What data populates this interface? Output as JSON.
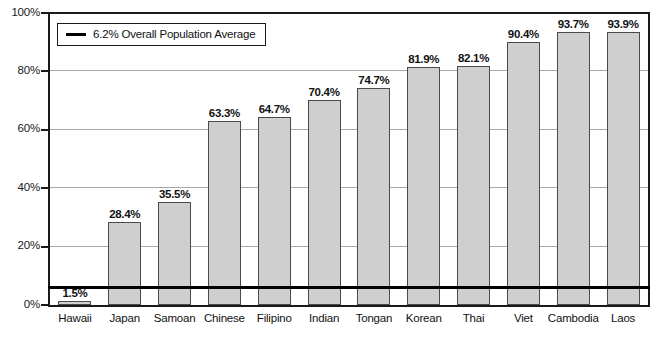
{
  "chart_data": {
    "type": "bar",
    "title": "",
    "xlabel": "",
    "ylabel": "",
    "ylim": [
      0,
      100
    ],
    "grid": true,
    "legend_position": "top-left",
    "categories": [
      "Hawaii",
      "Japan",
      "Samoan",
      "Chinese",
      "Filipino",
      "Indian",
      "Tongan",
      "Korean",
      "Thai",
      "Viet",
      "Cambodia",
      "Laos"
    ],
    "values": [
      1.5,
      28.4,
      35.5,
      63.3,
      64.7,
      70.4,
      74.7,
      81.9,
      82.1,
      90.4,
      93.7,
      93.9
    ],
    "value_labels": [
      "1.5%",
      "28.4%",
      "35.5%",
      "63.3%",
      "64.7%",
      "70.4%",
      "74.7%",
      "81.9%",
      "82.1%",
      "90.4%",
      "93.7%",
      "93.9%"
    ],
    "ytick_labels": [
      "0%",
      "20%",
      "40%",
      "60%",
      "80%",
      "100%"
    ],
    "ytick_values": [
      0,
      20,
      40,
      60,
      80,
      100
    ],
    "reference_line": {
      "value": 6.2,
      "label": "6.2% Overall Population Average"
    },
    "series_color": "#cfcfcf",
    "series_edge_color": "#4a4a4a",
    "reference_line_color": "#000000"
  },
  "legend": {
    "entry_label": "6.2% Overall Population Average",
    "swatch_name": "reference-line-swatch"
  },
  "footnote": {
    "text": ""
  }
}
